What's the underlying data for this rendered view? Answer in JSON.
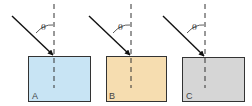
{
  "diagram": {
    "panels": [
      {
        "label": "A",
        "angle_symbol": "θ",
        "fill": "#c8e4f4"
      },
      {
        "label": "B",
        "angle_symbol": "θ",
        "fill": "#f6ddb0"
      },
      {
        "label": "C",
        "angle_symbol": "θ",
        "fill": "#d6d6d6"
      }
    ],
    "colors": {
      "stroke": "#222222",
      "text": "#444444"
    }
  }
}
